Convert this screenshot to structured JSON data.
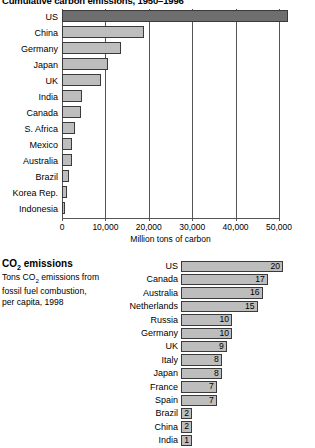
{
  "chart_data": [
    {
      "type": "bar",
      "orientation": "horizontal",
      "title": "Cumulative carbon emissions, 1950–1996",
      "xlabel": "Million tons of carbon",
      "ylabel": "",
      "xlim": [
        0,
        52000
      ],
      "axis_max_tick": 50000,
      "grid": true,
      "legend": "none",
      "tick_labels": [
        "0",
        "10,000",
        "20,000",
        "30,000",
        "40,000",
        "50,000"
      ],
      "tick_values": [
        0,
        10000,
        20000,
        30000,
        40000,
        50000
      ],
      "categories": [
        "US",
        "China",
        "Germany",
        "Japan",
        "UK",
        "India",
        "Canada",
        "S. Africa",
        "Mexico",
        "Australia",
        "Brazil",
        "Korea Rep.",
        "Indonesia"
      ],
      "values": [
        52000,
        19000,
        13500,
        10500,
        9000,
        4700,
        4400,
        3000,
        2400,
        2200,
        1600,
        1200,
        700
      ],
      "highlight_category": "US"
    },
    {
      "type": "bar",
      "orientation": "horizontal",
      "title": "CO2 emissions",
      "subtitle": "Tons CO2 emissions from fossil fuel combustion, per capita, 1998",
      "xlabel": "",
      "ylabel": "",
      "xlim": [
        0,
        20
      ],
      "grid": false,
      "legend": "none",
      "data_labels": true,
      "categories": [
        "US",
        "Canada",
        "Australia",
        "Netherlands",
        "Russia",
        "Germany",
        "UK",
        "Italy",
        "Japan",
        "France",
        "Spain",
        "Brazil",
        "China",
        "India"
      ],
      "values": [
        20,
        17,
        16,
        15,
        10,
        10,
        9,
        8,
        8,
        7,
        7,
        2,
        2,
        1
      ]
    }
  ],
  "chart1": {
    "title": "Cumulative carbon emissions, 1950–1996",
    "xlabel": "Million tons of carbon",
    "ticks": [
      "0",
      "10,000",
      "20,000",
      "30,000",
      "40,000",
      "50,000"
    ],
    "rows": [
      {
        "label": "US",
        "value": 52000
      },
      {
        "label": "China",
        "value": 19000
      },
      {
        "label": "Germany",
        "value": 13500
      },
      {
        "label": "Japan",
        "value": 10500
      },
      {
        "label": "UK",
        "value": 9000
      },
      {
        "label": "India",
        "value": 4700
      },
      {
        "label": "Canada",
        "value": 4400
      },
      {
        "label": "S. Africa",
        "value": 3000
      },
      {
        "label": "Mexico",
        "value": 2400
      },
      {
        "label": "Australia",
        "value": 2200
      },
      {
        "label": "Brazil",
        "value": 1600
      },
      {
        "label": "Korea Rep.",
        "value": 1200
      },
      {
        "label": "Indonesia",
        "value": 700
      }
    ]
  },
  "chart2": {
    "title_main": "CO",
    "title_sub": "2",
    "title_tail": " emissions",
    "subtitle_line1_a": "Tons CO",
    "subtitle_line1_b": "2",
    "subtitle_line1_c": " emissions from",
    "subtitle_line2": "fossil fuel combustion,",
    "subtitle_line3": "per capita, 1998",
    "rows": [
      {
        "label": "US",
        "value": 20,
        "value_text": "20"
      },
      {
        "label": "Canada",
        "value": 17,
        "value_text": "17"
      },
      {
        "label": "Australia",
        "value": 16,
        "value_text": "16"
      },
      {
        "label": "Netherlands",
        "value": 15,
        "value_text": "15"
      },
      {
        "label": "Russia",
        "value": 10,
        "value_text": "10"
      },
      {
        "label": "Germany",
        "value": 10,
        "value_text": "10"
      },
      {
        "label": "UK",
        "value": 9,
        "value_text": "9"
      },
      {
        "label": "Italy",
        "value": 8,
        "value_text": "8"
      },
      {
        "label": "Japan",
        "value": 8,
        "value_text": "8"
      },
      {
        "label": "France",
        "value": 7,
        "value_text": "7"
      },
      {
        "label": "Spain",
        "value": 7,
        "value_text": "7"
      },
      {
        "label": "Brazil",
        "value": 2,
        "value_text": "2"
      },
      {
        "label": "China",
        "value": 2,
        "value_text": "2"
      },
      {
        "label": "India",
        "value": 1,
        "value_text": "1"
      }
    ]
  }
}
